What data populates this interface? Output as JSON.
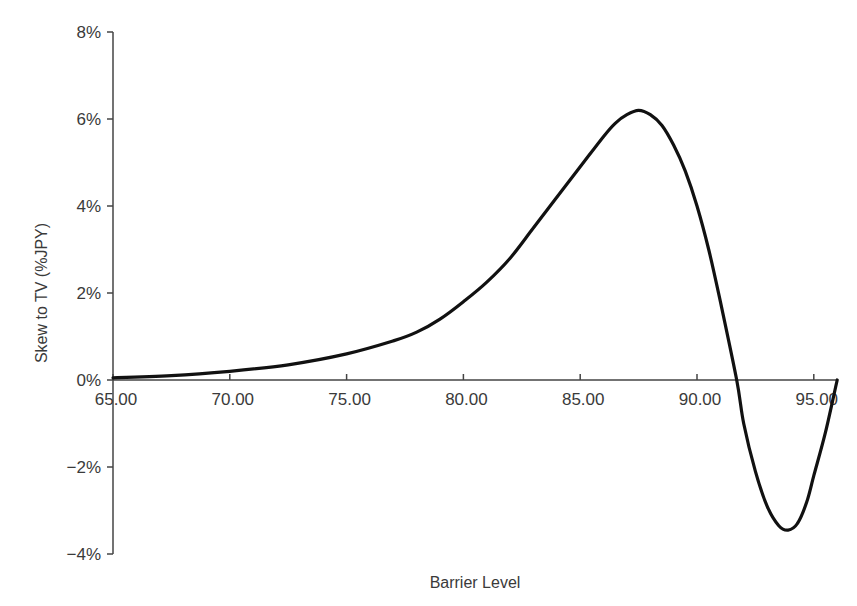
{
  "chart_data": {
    "type": "line",
    "title": "",
    "xlabel": "Barrier Level",
    "ylabel": "Skew to TV (%JPY)",
    "xlim": [
      65,
      96
    ],
    "ylim": [
      -4,
      8
    ],
    "grid": false,
    "legend": null,
    "x_ticks": [
      "65.00",
      "70.00",
      "75.00",
      "80.00",
      "85.00",
      "90.00",
      "95.00"
    ],
    "y_ticks": [
      "8%",
      "6%",
      "4%",
      "2%",
      "0%",
      "−2%",
      "−4%"
    ],
    "series": [
      {
        "name": "Skew to TV",
        "color": "#111111",
        "x": [
          65,
          67.5,
          70,
          72.5,
          75,
          77,
          78,
          79,
          80,
          81,
          82,
          83,
          84,
          85,
          86,
          86.5,
          87,
          87.5,
          88,
          88.5,
          89,
          89.5,
          90,
          90.5,
          91,
          91.7,
          92,
          92.5,
          93,
          93.5,
          93.9,
          94.3,
          94.7,
          95,
          95.5,
          96
        ],
        "values": [
          0.05,
          0.1,
          0.2,
          0.35,
          0.6,
          0.9,
          1.1,
          1.4,
          1.8,
          2.25,
          2.8,
          3.5,
          4.2,
          4.9,
          5.6,
          5.9,
          6.1,
          6.2,
          6.1,
          5.85,
          5.4,
          4.8,
          4.0,
          3.0,
          1.8,
          0.0,
          -1.0,
          -2.1,
          -2.9,
          -3.35,
          -3.45,
          -3.3,
          -2.8,
          -2.2,
          -1.2,
          0.0
        ]
      }
    ],
    "annotations": []
  },
  "axes": {
    "x_title": "Barrier Level",
    "y_title": "Skew to TV (%JPY)"
  }
}
